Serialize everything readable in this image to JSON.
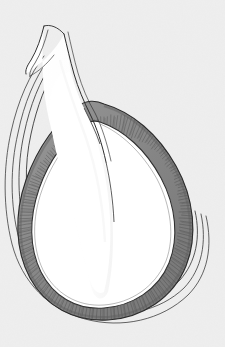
{
  "figure": {
    "domain": "Natural-Image",
    "medium": "pen-and-ink line drawing with graded grey wash",
    "orientation": "neck-upper-left, body-lower-right",
    "canvas": {
      "width": 225,
      "height": 347
    }
  },
  "palette": {
    "paper_background": "#eeeeee",
    "paper_background_edge": "#e4e4e4",
    "cavity_fill": "#ffffff",
    "palisade_band_light": "#9a9a9a",
    "palisade_band_mid": "#858585",
    "palisade_band_dark": "#6d6d6d",
    "striation_ink": "#4a4a4a",
    "contour_ink": "#3a3a3a",
    "outline_ink": "#2b2b2b",
    "wall_highlight": "#fcfcfc"
  },
  "structures": [
    {
      "id": "outer-contour-lines",
      "label": "Outer contour lines",
      "role": "outer wall / pericarp layering",
      "count": 4,
      "stroke_color": "#3a3a3a",
      "stroke_width": 0.8,
      "note": "Four fine concentric lines tracing the outside of the body, converging at the neck and spreading widest at the lower right"
    },
    {
      "id": "palisade-band",
      "label": "Striated band",
      "role": "palisade / cellular layer",
      "fill_color": "#8a8a8a",
      "texture": "fine radial striations",
      "striation_count": 168,
      "striation_color": "#4a4a4a",
      "thickness_px_min": 7,
      "thickness_px_max": 20,
      "note": "Thick grey band of radially elongate cells lining the cavity; thickest along the lower and right margins"
    },
    {
      "id": "inner-cavity",
      "label": "Inner cavity",
      "role": "locule / lumen",
      "fill_color": "#ffffff",
      "boundary": "irregular, finely scalloped",
      "note": "Open white chamber continuous with the channel running up through the neck"
    },
    {
      "id": "neck-channel",
      "label": "Neck channel",
      "role": "style / canal",
      "fill_color": "#ffffff",
      "wall_lines": 2,
      "note": "Narrow white passage curving up and to the left, flaring open at the cut apex"
    },
    {
      "id": "apex-opening",
      "label": "Cut apex",
      "role": "sectioned opening of the neck",
      "note": "The neck is truncated at the top of the plate, showing the open mouth of the canal"
    }
  ],
  "annotations": {
    "labels": [],
    "scale_bar": null,
    "caption": null,
    "note": "No lettering, numerals, scale bar or caption appear anywhere on the plate"
  }
}
